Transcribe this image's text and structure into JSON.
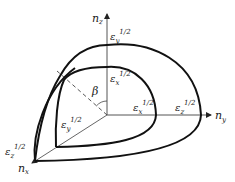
{
  "figure": {
    "type": "index-ellipsoid-octant",
    "axes": {
      "z": {
        "label": "n",
        "sub": "z"
      },
      "y": {
        "label": "n",
        "sub": "y"
      },
      "x": {
        "label": "n",
        "sub": "x"
      }
    },
    "angle_label": "β",
    "labels": {
      "outer_top": {
        "base": "ε",
        "sub": "y",
        "sup": "1/2"
      },
      "inner_top": {
        "base": "ε",
        "sub": "x",
        "sup": "1/2"
      },
      "inner_right": {
        "base": "ε",
        "sub": "x",
        "sup": "1/2"
      },
      "outer_right": {
        "base": "ε",
        "sub": "z",
        "sup": "1/2"
      },
      "inner_front": {
        "base": "ε",
        "sub": "y",
        "sup": "1/2"
      },
      "outer_front": {
        "base": "ε",
        "sub": "z",
        "sup": "1/2"
      }
    },
    "colors": {
      "stroke": "#111111",
      "axis": "#555555",
      "text": "#222222"
    }
  }
}
